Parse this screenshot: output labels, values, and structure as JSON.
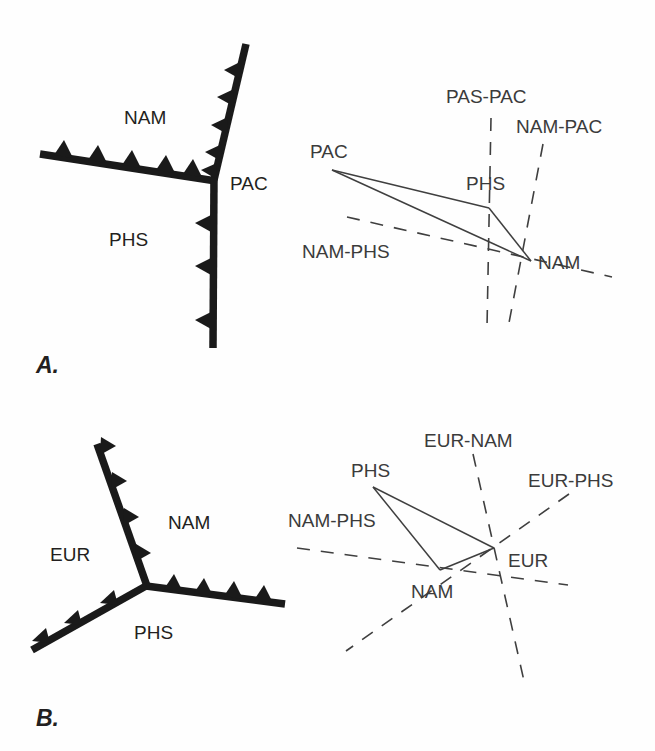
{
  "figure": {
    "background_color": "#fefefe",
    "line_color": "#1a1a1a",
    "velocity_line_color": "#3f3f3f"
  },
  "panels": [
    {
      "letter": "A.",
      "map": {
        "caption_plates": [
          "NAM",
          "PAC",
          "PHS"
        ],
        "labels": {
          "nam": "NAM",
          "pac": "PAC",
          "phs": "PHS"
        },
        "branches": [
          {
            "name": "northeast-trench",
            "barb_count": 5,
            "barb_side": "west"
          },
          {
            "name": "west-trench",
            "barb_count": 5,
            "barb_side": "north"
          },
          {
            "name": "south-trench",
            "barb_count": 3,
            "barb_side": "west"
          }
        ]
      },
      "velocity_diagram": {
        "vertices": [
          {
            "name": "PAC",
            "label": "PAC"
          },
          {
            "name": "PHS",
            "label": "PHS"
          },
          {
            "name": "NAM",
            "label": "NAM"
          }
        ],
        "constraint_lines": [
          {
            "name": "PAS-PAC",
            "label": "PAS-PAC"
          },
          {
            "name": "NAM-PAC",
            "label": "NAM-PAC"
          },
          {
            "name": "NAM-PHS",
            "label": "NAM-PHS"
          }
        ]
      }
    },
    {
      "letter": "B.",
      "map": {
        "caption_plates": [
          "NAM",
          "EUR",
          "PHS"
        ],
        "labels": {
          "nam": "NAM",
          "eur": "EUR",
          "phs": "PHS"
        },
        "branches": [
          {
            "name": "north-trench",
            "barb_count": 4,
            "barb_side": "east"
          },
          {
            "name": "east-trench",
            "barb_count": 4,
            "barb_side": "north"
          },
          {
            "name": "southwest-trench",
            "barb_count": 3,
            "barb_side": "northwest"
          }
        ]
      },
      "velocity_diagram": {
        "vertices": [
          {
            "name": "PHS",
            "label": "PHS"
          },
          {
            "name": "NAM",
            "label": "NAM"
          },
          {
            "name": "EUR",
            "label": "EUR"
          }
        ],
        "constraint_lines": [
          {
            "name": "EUR-NAM",
            "label": "EUR-NAM"
          },
          {
            "name": "EUR-PHS",
            "label": "EUR-PHS"
          },
          {
            "name": "NAM-PHS",
            "label": "NAM-PHS"
          }
        ]
      }
    }
  ]
}
